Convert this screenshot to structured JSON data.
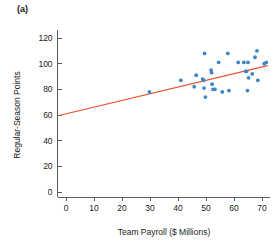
{
  "panel": {
    "label": "(a)"
  },
  "chart_data": {
    "type": "scatter",
    "title": "",
    "xlabel": "Team Payroll ($ Millions)",
    "ylabel": "Regular-Season Points",
    "xlim": [
      -3,
      73
    ],
    "ylim": [
      -4,
      126
    ],
    "xticks": [
      0,
      10,
      20,
      30,
      40,
      50,
      60,
      70
    ],
    "yticks": [
      0,
      20,
      40,
      60,
      80,
      100,
      120
    ],
    "xticklabels": [
      "0",
      "10",
      "20",
      "30",
      "40",
      "50",
      "60",
      "70"
    ],
    "yticklabels": [
      "0",
      "20",
      "40",
      "60",
      "80",
      "100",
      "120"
    ],
    "grid": false,
    "legend": null,
    "point_color": "#3d86c6",
    "trend_color": "#e8502a",
    "points": [
      {
        "x": 29.8,
        "y": 78
      },
      {
        "x": 41.0,
        "y": 87
      },
      {
        "x": 45.8,
        "y": 82
      },
      {
        "x": 46.5,
        "y": 91
      },
      {
        "x": 48.8,
        "y": 88
      },
      {
        "x": 49.2,
        "y": 87
      },
      {
        "x": 49.3,
        "y": 81
      },
      {
        "x": 49.5,
        "y": 108
      },
      {
        "x": 49.8,
        "y": 74
      },
      {
        "x": 51.8,
        "y": 95
      },
      {
        "x": 52.0,
        "y": 93
      },
      {
        "x": 52.2,
        "y": 84
      },
      {
        "x": 52.5,
        "y": 80
      },
      {
        "x": 53.2,
        "y": 80
      },
      {
        "x": 54.5,
        "y": 101
      },
      {
        "x": 55.8,
        "y": 78
      },
      {
        "x": 57.8,
        "y": 108
      },
      {
        "x": 58.2,
        "y": 79
      },
      {
        "x": 61.5,
        "y": 101
      },
      {
        "x": 63.5,
        "y": 101
      },
      {
        "x": 64.2,
        "y": 94
      },
      {
        "x": 64.5,
        "y": 94
      },
      {
        "x": 64.8,
        "y": 79
      },
      {
        "x": 65.0,
        "y": 101
      },
      {
        "x": 65.2,
        "y": 89
      },
      {
        "x": 66.5,
        "y": 92
      },
      {
        "x": 67.5,
        "y": 105
      },
      {
        "x": 68.2,
        "y": 110
      },
      {
        "x": 68.5,
        "y": 87
      },
      {
        "x": 70.8,
        "y": 100
      },
      {
        "x": 71.5,
        "y": 101
      }
    ],
    "trend_series": {
      "name": "least-squares fit",
      "x": [
        -2.5,
        72.0
      ],
      "y": [
        59.6,
        98.5
      ]
    }
  }
}
